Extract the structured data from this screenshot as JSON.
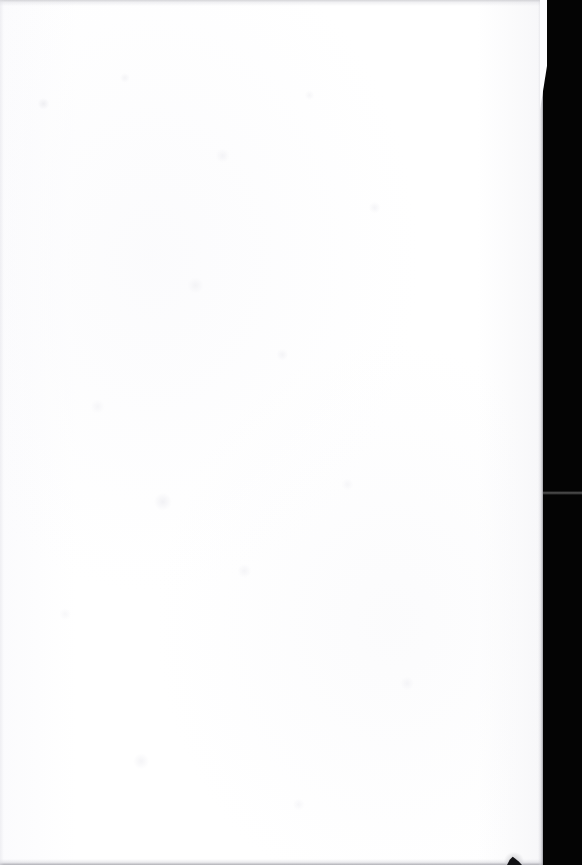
{
  "document": {
    "kind": "scanned-page",
    "page_state": "blank",
    "width_px": 582,
    "height_px": 865,
    "visible_text": ""
  },
  "colors": {
    "paper": "#FEFEFF",
    "scanner_backdrop": "#040404",
    "edge_shadow": "#9A9AA2",
    "seam_line": "#4A4A4A",
    "ink_smudge": "#111114"
  },
  "regions": {
    "paper_sheet": {
      "name": "paper-sheet",
      "left_px": 0,
      "top_px": 0,
      "width_px": 543,
      "height_px": 865
    },
    "scanner_backdrop": {
      "name": "scanner-backdrop",
      "left_px": 542,
      "top_px": 0,
      "width_px": 40,
      "height_px": 865
    },
    "backdrop_seam": {
      "name": "backdrop-seam-line",
      "left_px": 542,
      "top_px": 492,
      "width_px": 40,
      "height_px": 3
    },
    "ink_smudge": {
      "name": "ink-smudge",
      "left_px": 504,
      "top_px": 852,
      "width_px": 20,
      "height_px": 13
    }
  },
  "marks": {
    "top_edge_shadow": "top-edge-shadow",
    "bottom_edge_shadow": "bottom-edge-shadow",
    "left_edge_shadow": "left-edge-shadow",
    "right_edge_shadow": "right-edge-shadow"
  },
  "caption": "Blank scanned page with black scanner backdrop along the right edge"
}
